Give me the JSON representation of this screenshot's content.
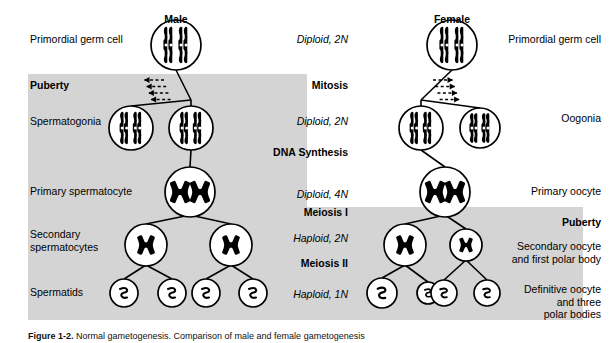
{
  "figure": {
    "caption_label": "Figure 1-2.",
    "caption_text": " Normal gametogenesis. Comparison of male and female gametogenesis",
    "shading_color": "#d4d4d4",
    "line_color": "#000000"
  },
  "headers": {
    "male": "Male",
    "female": "Female"
  },
  "left_column": [
    {
      "text": "Primordial germ cell",
      "bold": false
    },
    {
      "text": "Puberty",
      "bold": true
    },
    {
      "text": "Spermatogonia",
      "bold": false
    },
    {
      "text": "Primary spermatocyte",
      "bold": false
    },
    {
      "text": "Secondary\nspermatocytes",
      "bold": false
    },
    {
      "text": "Spermatids",
      "bold": false
    }
  ],
  "center_column": [
    {
      "text": "Diploid, 2N",
      "style": "italic"
    },
    {
      "text": "Mitosis",
      "style": "bold"
    },
    {
      "text": "Diploid, 2N",
      "style": "italic"
    },
    {
      "text": "DNA Synthesis",
      "style": "bold"
    },
    {
      "text": "Diploid, 4N",
      "style": "italic"
    },
    {
      "text": "Meiosis I",
      "style": "bold"
    },
    {
      "text": "Haploid, 2N",
      "style": "italic"
    },
    {
      "text": "Meiosis II",
      "style": "bold"
    },
    {
      "text": "Haploid, 1N",
      "style": "italic"
    }
  ],
  "right_column": [
    {
      "text": "Primordial germ cell",
      "bold": false
    },
    {
      "text": "Oogonia",
      "bold": false
    },
    {
      "text": "Primary oocyte",
      "bold": false
    },
    {
      "text": "Puberty",
      "bold": true
    },
    {
      "text": "Secondary oocyte\nand first polar body",
      "bold": false
    },
    {
      "text": "Definitive oocyte\nand three\npolar bodies",
      "bold": false
    }
  ],
  "male_tree": {
    "primordial": {
      "cx": 176,
      "cy": 45,
      "r": 25,
      "content": "rods-2pair"
    },
    "spermatogonia": [
      {
        "cx": 131,
        "cy": 128,
        "r": 22,
        "content": "rods-2pair"
      },
      {
        "cx": 191,
        "cy": 128,
        "r": 22,
        "content": "rods-2pair"
      }
    ],
    "primary_spermatocyte": {
      "cx": 190,
      "cy": 192,
      "r": 25,
      "content": "tetrad-2"
    },
    "secondary_spermatocytes": [
      {
        "cx": 146,
        "cy": 245,
        "r": 21,
        "content": "tetrad-1"
      },
      {
        "cx": 231,
        "cy": 245,
        "r": 21,
        "content": "tetrad-1"
      }
    ],
    "spermatids": [
      {
        "cx": 124,
        "cy": 293,
        "r": 14,
        "content": "squiggle"
      },
      {
        "cx": 172,
        "cy": 293,
        "r": 14,
        "content": "squiggle"
      },
      {
        "cx": 206,
        "cy": 293,
        "r": 14,
        "content": "squiggle"
      },
      {
        "cx": 253,
        "cy": 293,
        "r": 14,
        "content": "squiggle"
      }
    ],
    "repeated_division_arrows": 4,
    "arrow_direction": "left"
  },
  "female_tree": {
    "primordial": {
      "cx": 452,
      "cy": 45,
      "r": 25,
      "content": "rods-2pair"
    },
    "oogonia": [
      {
        "cx": 421,
        "cy": 128,
        "r": 22,
        "content": "rods-2pair"
      },
      {
        "cx": 480,
        "cy": 128,
        "r": 20,
        "content": "rods-2pair"
      }
    ],
    "primary_oocyte": {
      "cx": 445,
      "cy": 192,
      "r": 25,
      "content": "tetrad-2"
    },
    "secondary_oocyte": {
      "cx": 405,
      "cy": 245,
      "r": 21,
      "content": "tetrad-1"
    },
    "first_polar_body": {
      "cx": 466,
      "cy": 245,
      "r": 16,
      "content": "tetrad-1"
    },
    "definitive_oocyte": {
      "cx": 382,
      "cy": 293,
      "r": 15,
      "content": "squiggle"
    },
    "polar_bodies": [
      {
        "cx": 428,
        "cy": 293,
        "r": 11,
        "content": "squiggle"
      },
      {
        "cx": 444,
        "cy": 293,
        "r": 13,
        "content": "squiggle"
      },
      {
        "cx": 487,
        "cy": 293,
        "r": 13,
        "content": "squiggle"
      }
    ],
    "repeated_division_arrows": 4,
    "arrow_direction": "right"
  },
  "label_positions": {
    "left": [
      {
        "x": 30,
        "y": 33
      },
      {
        "x": 30,
        "y": 79
      },
      {
        "x": 30,
        "y": 115
      },
      {
        "x": 30,
        "y": 185
      },
      {
        "x": 30,
        "y": 228
      },
      {
        "x": 30,
        "y": 286
      }
    ],
    "center": [
      {
        "x": 278,
        "y": 33
      },
      {
        "x": 278,
        "y": 79
      },
      {
        "x": 278,
        "y": 115
      },
      {
        "x": 268,
        "y": 146
      },
      {
        "x": 278,
        "y": 188
      },
      {
        "x": 283,
        "y": 206
      },
      {
        "x": 278,
        "y": 232
      },
      {
        "x": 283,
        "y": 257
      },
      {
        "x": 278,
        "y": 288
      }
    ],
    "right": [
      {
        "x": 509,
        "y": 33
      },
      {
        "x": 509,
        "y": 112
      },
      {
        "x": 509,
        "y": 185
      },
      {
        "x": 509,
        "y": 216
      },
      {
        "x": 509,
        "y": 240
      },
      {
        "x": 509,
        "y": 283
      }
    ]
  }
}
